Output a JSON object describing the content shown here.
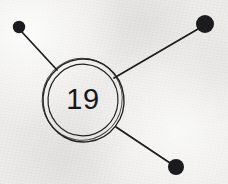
{
  "figure": {
    "kind": "node-link-diagram",
    "background_color": "#ecebe9",
    "ink_color": "#1b1b1d",
    "canvas": {
      "width": 228,
      "height": 184
    },
    "center_node": {
      "label": "19",
      "center_x": 83,
      "center_y": 99,
      "outer_radius": 41,
      "inner_radius": 35,
      "ring_count": 2,
      "stroke_width": 1.3
    },
    "endpoint_nodes": [
      {
        "name": "top-left-node",
        "center_x": 19,
        "center_y": 27,
        "radius": 6.2,
        "fill": "#1b1b1d"
      },
      {
        "name": "top-right-node",
        "center_x": 205,
        "center_y": 24,
        "radius": 9.0,
        "fill": "#1b1b1d"
      },
      {
        "name": "bottom-right-node",
        "center_x": 176,
        "center_y": 167,
        "radius": 8.0,
        "fill": "#1b1b1d"
      }
    ],
    "connectors": [
      {
        "name": "connector-top-left",
        "x1": 21,
        "y1": 31,
        "x2": 57,
        "y2": 70,
        "stroke_width": 1.6
      },
      {
        "name": "connector-top-right",
        "x1": 198,
        "y1": 29,
        "x2": 114,
        "y2": 78,
        "stroke_width": 1.6
      },
      {
        "name": "connector-bottom-right",
        "x1": 170,
        "y1": 163,
        "x2": 116,
        "y2": 127,
        "stroke_width": 1.6
      }
    ]
  }
}
